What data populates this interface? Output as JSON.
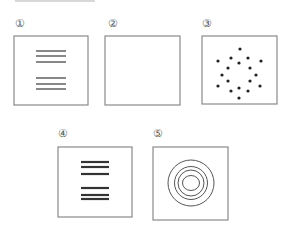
{
  "figure": {
    "panels": [
      {
        "id": 1,
        "label": "①",
        "content": "two groups of three horizontal lines",
        "line_groups": [
          3,
          3
        ],
        "line_weight": "thin"
      },
      {
        "id": 2,
        "label": "②",
        "content": "empty"
      },
      {
        "id": 3,
        "label": "③",
        "content": "scattered dots",
        "dot_count": 18
      },
      {
        "id": 4,
        "label": "④",
        "content": "two groups of three horizontal lines",
        "line_groups": [
          3,
          3
        ],
        "line_weight": "thick"
      },
      {
        "id": 5,
        "label": "⑤",
        "content": "concentric circles",
        "circle_count": 4
      }
    ],
    "colors": {
      "stroke": "#8a8a8a",
      "ink": "#333333",
      "dots": "#222222"
    }
  }
}
